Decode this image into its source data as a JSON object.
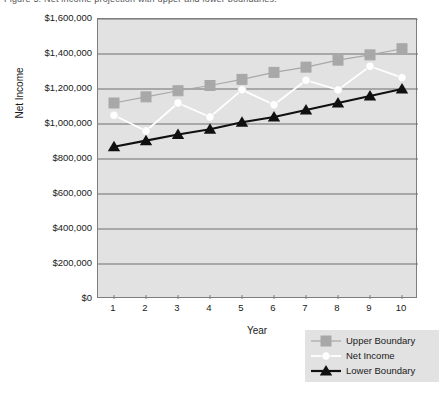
{
  "caption": {
    "text": "Figure 5. Net income projection with upper and lower boundaries."
  },
  "chart_data": {
    "type": "line",
    "title": "",
    "xlabel": "Year",
    "ylabel": "Net Income",
    "x": [
      1,
      2,
      3,
      4,
      5,
      6,
      7,
      8,
      9,
      10
    ],
    "categories": [
      "1",
      "2",
      "3",
      "4",
      "5",
      "6",
      "7",
      "8",
      "9",
      "10"
    ],
    "xlim": [
      0.5,
      10.5
    ],
    "ylim": [
      0,
      1600000
    ],
    "yticks": [
      0,
      200000,
      400000,
      600000,
      800000,
      1000000,
      1200000,
      1400000,
      1600000
    ],
    "ytick_labels": [
      "$0",
      "$200,000",
      "$400,000",
      "$600,000",
      "$800,000",
      "$1,000,000",
      "$1,200,000",
      "$1,400,000",
      "$1,600,000"
    ],
    "grid": true,
    "grid_axis": "y",
    "legend_position": "bottom-right",
    "plot_background": "#e2e2e2",
    "grid_color": "#6e6e6e",
    "series": [
      {
        "name": "Upper Boundary",
        "marker": "square",
        "color": "#a8a8a8",
        "line_color": "#a8a8a8",
        "values": [
          1120000,
          1155000,
          1190000,
          1220000,
          1255000,
          1295000,
          1325000,
          1365000,
          1395000,
          1430000
        ]
      },
      {
        "name": "Net Income",
        "marker": "circle",
        "color": "#ffffff",
        "line_color": "#ffffff",
        "values": [
          1050000,
          960000,
          1120000,
          1040000,
          1195000,
          1110000,
          1250000,
          1195000,
          1330000,
          1265000
        ]
      },
      {
        "name": "Lower Boundary",
        "marker": "triangle",
        "color": "#101010",
        "line_color": "#101010",
        "values": [
          870000,
          905000,
          940000,
          970000,
          1010000,
          1040000,
          1080000,
          1120000,
          1160000,
          1200000
        ]
      }
    ]
  }
}
